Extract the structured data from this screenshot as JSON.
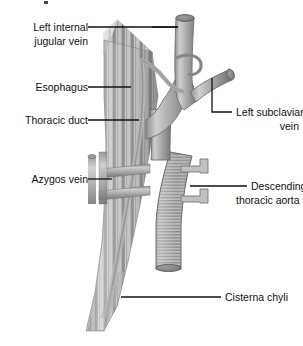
{
  "figure": {
    "background_color": "#ffffff",
    "width": 303,
    "height": 346
  },
  "palette": {
    "outline": "#6f6f6f",
    "vein_light": "#c9c9c9",
    "vein_mid": "#9a9a9a",
    "vein_dark": "#6d6d6d",
    "esophagus_light": "#c6c6c6",
    "esophagus_dark": "#838383",
    "aorta_light": "#bdbdbd",
    "aorta_dark": "#7a7a7a",
    "label_text": "#111111",
    "leader_line": "#111111"
  },
  "labels": [
    {
      "id": "left-internal-jugular-vein",
      "line1": "Left internal",
      "line2": "jugular vein",
      "side": "left",
      "text_x": 88,
      "text_y": 31,
      "line_height": 14
    },
    {
      "id": "esophagus",
      "line1": "Esophagus",
      "line2": "",
      "side": "left",
      "text_x": 88,
      "text_y": 91,
      "line_height": 14
    },
    {
      "id": "thoracic-duct",
      "line1": "Thoracic duct",
      "line2": "",
      "side": "left",
      "text_x": 88,
      "text_y": 124,
      "line_height": 14
    },
    {
      "id": "azygos-vein",
      "line1": "Azygos vein",
      "line2": "",
      "side": "left",
      "text_x": 88,
      "text_y": 183,
      "line_height": 14
    },
    {
      "id": "left-subclavian-vein",
      "line1": "Left subclavian",
      "line2": "vein",
      "side": "right",
      "text_x": 219,
      "text_y": 116,
      "line_height": 14
    },
    {
      "id": "descending-thoracic-aorta",
      "line1": "Descending",
      "line2": "thoracic aorta",
      "side": "right",
      "text_x": 237,
      "text_y": 190,
      "line_height": 14
    },
    {
      "id": "cisterna-chyli",
      "line1": "Cisterna chyli",
      "line2": "",
      "side": "right",
      "text_x": 225,
      "text_y": 301,
      "line_height": 14
    }
  ],
  "structures": [
    {
      "id": "left-internal-jugular-vein",
      "name": "Left internal jugular vein"
    },
    {
      "id": "left-subclavian-vein",
      "name": "Left subclavian vein"
    },
    {
      "id": "left-brachiocephalic-vein",
      "name": "Left brachiocephalic vein"
    },
    {
      "id": "esophagus",
      "name": "Esophagus"
    },
    {
      "id": "thoracic-duct",
      "name": "Thoracic duct"
    },
    {
      "id": "azygos-vein",
      "name": "Azygos vein"
    },
    {
      "id": "descending-thoracic-aorta",
      "name": "Descending thoracic aorta"
    },
    {
      "id": "cisterna-chyli",
      "name": "Cisterna chyli"
    },
    {
      "id": "posterior-intercostal-arteries",
      "name": "Posterior intercostal arteries"
    }
  ]
}
